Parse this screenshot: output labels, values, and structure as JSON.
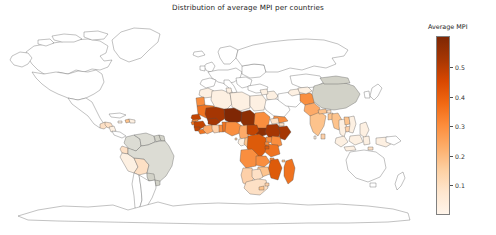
{
  "figure": {
    "background_color": "#ffffff",
    "width": 496,
    "height": 235
  },
  "title": "Distribution of average MPI per countries",
  "colorbar": {
    "label": "Average MPI",
    "ticks": [
      "0.1",
      "0.2",
      "0.3",
      "0.4",
      "0.5"
    ],
    "tick_values": [
      0.1,
      0.2,
      0.3,
      0.4,
      0.5
    ],
    "vmin": 0.0,
    "vmax": 0.605,
    "colormap": "Oranges",
    "low_color": "#fff5eb",
    "mid_color": "#f16913",
    "high_color": "#7f2704",
    "no_data_color": "#ffffff",
    "outline_color": "#4d4d4d"
  },
  "chart_data": {
    "type": "heatmap",
    "title": "Distribution of average MPI per countries",
    "xlabel": "",
    "ylabel": "",
    "legend_position": "right",
    "grid": false,
    "value_label": "Average MPI",
    "colorbar_range": [
      0.0,
      0.605
    ],
    "colorbar_ticks": [
      0.1,
      0.2,
      0.3,
      0.4,
      0.5
    ],
    "projection": "equirectangular",
    "categories": [
      "Niger",
      "Chad",
      "Burkina Faso",
      "Mali",
      "Ethiopia",
      "Somalia",
      "South Sudan",
      "Guinea",
      "Sierra Leone",
      "Central African Republic",
      "Mozambique",
      "Nigeria",
      "Senegal",
      "Madagascar",
      "Benin",
      "Liberia",
      "Democratic Republic of the Congo",
      "Sudan",
      "Yemen",
      "Afghanistan",
      "India",
      "Cambodia",
      "Myanmar",
      "Pakistan",
      "Bangladesh",
      "Nepal",
      "Peru",
      "Bolivia",
      "Haiti",
      "Guatemala",
      "Honduras",
      "China",
      "Mongolia",
      "Brazil",
      "Kazakhstan",
      "Indonesia",
      "Philippines",
      "Tanzania",
      "Kenya",
      "Uganda",
      "Zambia",
      "Zimbabwe",
      "Angola",
      "Cameroon",
      "Ghana",
      "Ivory Coast",
      "Mauritania",
      "Namibia",
      "South Africa",
      "Morocco",
      "Algeria",
      "Egypt",
      "Libya",
      "Tunisia",
      "Gabon",
      "Congo",
      "Malawi",
      "Rwanda",
      "Burundi",
      "Togo",
      "Thailand",
      "Vietnam",
      "Laos",
      "Iraq",
      "Syria",
      "Turkmenistan",
      "Uzbekistan",
      "Tajikistan",
      "Kyrgyzstan",
      "Armenia",
      "Colombia",
      "Ecuador",
      "Paraguay",
      "Suriname",
      "Guyana",
      "Mexico",
      "Nicaragua",
      "Dominican Republic",
      "Jamaica",
      "Trinidad and Tobago",
      "Belize",
      "Gambia",
      "Guinea-Bissau",
      "Djibouti",
      "Eritrea",
      "Lesotho",
      "Swaziland",
      "Botswana",
      "Sao Tome and Principe",
      "Comoros",
      "Timor-Leste",
      "Maldives",
      "Bhutan",
      "Sri Lanka",
      "Azerbaijan",
      "Moldova",
      "Ukraine",
      "Serbia",
      "Bosnia and Herzegovina",
      "North Macedonia",
      "Albania",
      "Montenegro"
    ],
    "values": [
      0.605,
      0.545,
      0.535,
      0.457,
      0.489,
      0.5,
      0.58,
      0.425,
      0.464,
      0.465,
      0.389,
      0.291,
      0.309,
      0.357,
      0.368,
      0.356,
      0.389,
      0.279,
      0.241,
      0.272,
      0.191,
      0.146,
      0.176,
      0.23,
      0.188,
      0.127,
      0.043,
      0.097,
      0.242,
      0.127,
      0.09,
      0.023,
      0.035,
      0.012,
      0.002,
      0.028,
      0.024,
      0.335,
      0.187,
      0.272,
      0.264,
      0.145,
      0.282,
      0.248,
      0.138,
      0.236,
      0.291,
      0.171,
      0.041,
      0.069,
      0.019,
      0.02,
      0.005,
      0.004,
      0.07,
      0.181,
      0.265,
      0.259,
      0.403,
      0.284,
      0.005,
      0.019,
      0.174,
      0.045,
      0.029,
      0.004,
      0.008,
      0.031,
      0.008,
      0.001,
      0.032,
      0.011,
      0.019,
      0.029,
      0.014,
      0.024,
      0.072,
      0.015,
      0.011,
      0.009,
      0.017,
      0.289,
      0.372,
      0.127,
      0.231,
      0.156,
      0.113,
      0.073,
      0.154,
      0.181,
      0.21,
      0.028,
      0.128,
      0.011,
      0.009,
      0.004,
      0.002,
      0.001,
      0.008,
      0.004,
      0.003,
      0.003
    ]
  }
}
